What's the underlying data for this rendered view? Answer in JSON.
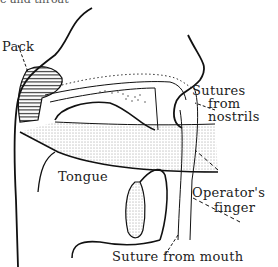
{
  "figure": {
    "caption_cutoff": "e and throat",
    "labels": {
      "pack": "Pack",
      "sutures_line1": "Sutures",
      "sutures_line2": "from",
      "sutures_line3": "nostrils",
      "tongue": "Tongue",
      "finger_line1": "Operator's",
      "finger_line2": "finger",
      "suture_mouth": "Suture from mouth"
    },
    "colors": {
      "ink": "#111111",
      "background": "#ffffff"
    }
  }
}
